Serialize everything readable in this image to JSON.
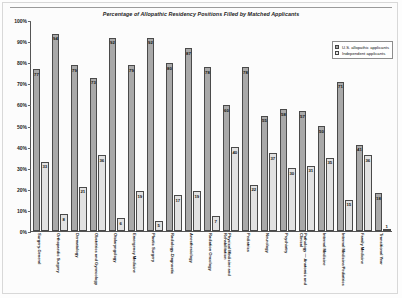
{
  "page": {
    "ghost_header": "",
    "title": "Percentage of Allopathic Residency Positions Filled by Matched Applicants"
  },
  "legend": {
    "position": "top-right",
    "entries": [
      {
        "label": "U.S. allopathic applicants",
        "color": "#a9a9a9",
        "key": "us"
      },
      {
        "label": "Independent applicants",
        "color": "#e9e9e9",
        "key": "ind"
      }
    ]
  },
  "axes": {
    "ylabel": "",
    "xlabel": "",
    "ylim": [
      0,
      100
    ],
    "ytick_labels": [
      "0%",
      "10%",
      "20%",
      "30%",
      "40%",
      "50%",
      "60%",
      "70%",
      "80%",
      "90%",
      "100%"
    ],
    "ytick_values": [
      0,
      10,
      20,
      30,
      40,
      50,
      60,
      70,
      80,
      90,
      100
    ],
    "grid": false
  },
  "chart_data": {
    "type": "bar",
    "title": "Percentage of Allopathic Residency Positions Filled by Matched Applicants",
    "xlabel": "",
    "ylabel": "",
    "ylim": [
      0,
      100
    ],
    "grid": false,
    "legend_position": "top-right",
    "categories": [
      "Surgery-General",
      "Orthopaedic Surgery",
      "Dermatology",
      "Obstetrics and Gynecology",
      "Otolaryngology",
      "Emergency Medicine",
      "Plastic Surgery",
      "Radiology-Diagnostic",
      "Anesthesiology",
      "Radiation Oncology",
      "Physical Medicine and Rehabilitation",
      "Pediatrics",
      "Neurology",
      "Psychiatry",
      "Pathology — Anatomic and Clinical",
      "Internal Medicine",
      "Internal Medicine/Pediatrics",
      "Family Medicine",
      "Transitional Year"
    ],
    "series": [
      {
        "name": "U.S. allopathic applicants",
        "color": "#a9a9a9",
        "values": [
          77,
          94,
          79,
          73,
          92,
          79,
          92,
          80,
          87,
          78,
          60,
          78,
          55,
          58,
          57,
          50,
          71,
          41,
          18
        ]
      },
      {
        "name": "Independent applicants",
        "color": "#e9e9e9",
        "values": [
          33,
          8,
          21,
          36,
          6,
          19,
          5,
          17,
          19,
          7,
          40,
          22,
          37,
          30,
          31,
          35,
          15,
          36,
          1
        ]
      }
    ]
  }
}
